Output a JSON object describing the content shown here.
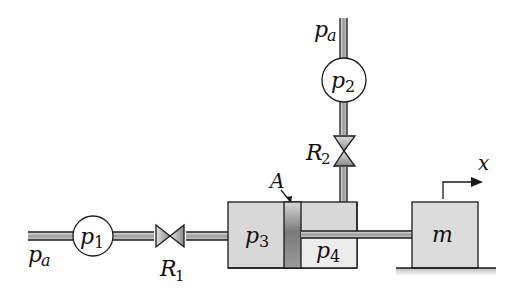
{
  "diagram": {
    "type": "hydraulic-schematic",
    "labels": {
      "pa_left": {
        "base": "p",
        "sub": "a"
      },
      "pa_top": {
        "base": "p",
        "sub": "a"
      },
      "p1": {
        "base": "p",
        "sub": "1"
      },
      "p2": {
        "base": "p",
        "sub": "2"
      },
      "p3": {
        "base": "p",
        "sub": "3"
      },
      "p4": {
        "base": "p",
        "sub": "4"
      },
      "R1": {
        "base": "R",
        "sub": "1"
      },
      "R2": {
        "base": "R",
        "sub": "2"
      },
      "A": "A",
      "m": "m",
      "x": "x"
    },
    "colors": {
      "line": "#1a1a1a",
      "pipe_fill": "#a8a8a8",
      "cylinder_fill": "#d6d6d6",
      "piston_fill": "#8a8a8a",
      "mass_fill": "#dcdcdc",
      "valve_fill": "#9a9a9a"
    }
  }
}
